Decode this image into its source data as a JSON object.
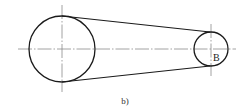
{
  "figure": {
    "caption": "b)",
    "type": "belt-drive schematic"
  },
  "diagram": {
    "large_pulley": {
      "cx": 62,
      "cy": 49,
      "r": 33
    },
    "small_pulley": {
      "cx": 211,
      "cy": 49,
      "r": 17,
      "label": "B"
    },
    "belt": {
      "upper": {
        "x1": 62,
        "y1": 16,
        "x2": 210,
        "y2": 32
      },
      "lower": {
        "x1": 62,
        "y1": 82,
        "x2": 210,
        "y2": 66
      }
    },
    "centerlines": {
      "horizontal": {
        "x1": 18,
        "x2": 236,
        "y": 49
      },
      "large_vertical": {
        "x": 62,
        "y1": 5,
        "y2": 92
      },
      "small_vertical": {
        "x": 211,
        "y1": 24,
        "y2": 76
      }
    }
  },
  "colors": {
    "outline": "#1a1a1a",
    "centerline": "#8a8a8a",
    "background": "#ffffff"
  }
}
